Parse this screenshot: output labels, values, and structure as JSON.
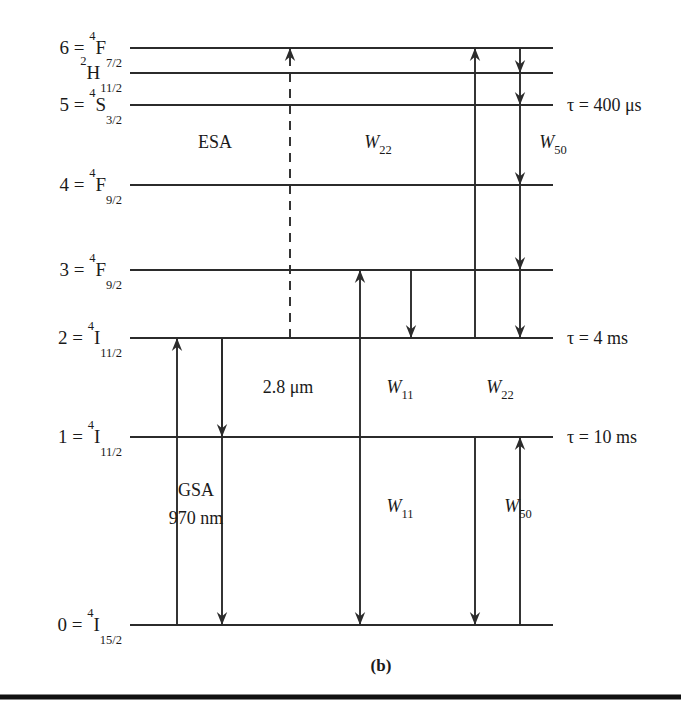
{
  "figure": {
    "caption": "(b)",
    "background_color": "#ffffff",
    "ink_color": "#2b2b2b",
    "width": 681,
    "height": 716
  },
  "chart_data": {
    "type": "diagram",
    "diagram_kind": "energy-level",
    "x_extent": [
      130,
      553
    ],
    "levels": [
      {
        "id": "L6",
        "index": "6",
        "eq": "=",
        "term_sup": "4",
        "term_letter": "F",
        "term_sub": "7/2",
        "label": "6 = 4F7/2",
        "y": 48,
        "x1": 130,
        "x2": 553,
        "lifetime": ""
      },
      {
        "id": "LH",
        "index": "",
        "eq": "",
        "term_sup": "2",
        "term_letter": "H",
        "term_sub": "11/2",
        "label": "2H11/2",
        "y": 73,
        "x1": 130,
        "x2": 553,
        "lifetime": ""
      },
      {
        "id": "L5",
        "index": "5",
        "eq": "=",
        "term_sup": "4",
        "term_letter": "S",
        "term_sub": "3/2",
        "label": "5 = 4S3/2",
        "y": 105,
        "x1": 130,
        "x2": 553,
        "lifetime": "τ = 400 μs"
      },
      {
        "id": "L4",
        "index": "4",
        "eq": "=",
        "term_sup": "4",
        "term_letter": "F",
        "term_sub": "9/2",
        "label": "4 = 4F9/2",
        "y": 185,
        "x1": 130,
        "x2": 553,
        "lifetime": ""
      },
      {
        "id": "L3",
        "index": "3",
        "eq": "=",
        "term_sup": "4",
        "term_letter": "F",
        "term_sub": "9/2",
        "label": "3 = 4F9/2",
        "y": 270,
        "x1": 130,
        "x2": 553,
        "lifetime": ""
      },
      {
        "id": "L2",
        "index": "2",
        "eq": "=",
        "term_sup": "4",
        "term_letter": "I",
        "term_sub": "11/2",
        "label": "2 = 4I11/2",
        "y": 338,
        "x1": 130,
        "x2": 553,
        "lifetime": "τ = 4 ms"
      },
      {
        "id": "L1",
        "index": "1",
        "eq": "=",
        "term_sup": "4",
        "term_letter": "I",
        "term_sub": "11/2",
        "label": "1 = 4I11/2",
        "y": 437,
        "x1": 130,
        "x2": 553,
        "lifetime": "τ = 10 ms"
      },
      {
        "id": "L0",
        "index": "0",
        "eq": "=",
        "term_sup": "4",
        "term_letter": "I",
        "term_sub": "15/2",
        "label": "0 = 4I15/2",
        "y": 625,
        "x1": 130,
        "x2": 553,
        "lifetime": ""
      }
    ],
    "transitions": [
      {
        "id": "esa",
        "x": 290,
        "from_y": 338,
        "to_y": 48,
        "direction": "up",
        "style": "dashed",
        "from_level": "L2",
        "to_level": "L6"
      },
      {
        "id": "gsa",
        "x": 177,
        "from_y": 625,
        "to_y": 338,
        "direction": "up",
        "style": "solid",
        "from_level": "L0",
        "to_level": "L2"
      },
      {
        "id": "decay-2-1",
        "x": 222,
        "from_y": 338,
        "to_y": 437,
        "direction": "down",
        "style": "solid",
        "from_level": "L2",
        "to_level": "L1"
      },
      {
        "id": "decay-2-0",
        "x": 222,
        "from_y": 338,
        "to_y": 625,
        "direction": "down",
        "style": "solid",
        "from_level": "L2",
        "to_level": "L0"
      },
      {
        "id": "w11-up",
        "x": 360,
        "from_y": 437,
        "to_y": 270,
        "direction": "up",
        "style": "solid",
        "from_level": "L1",
        "to_level": "L3"
      },
      {
        "id": "w11-down",
        "x": 411,
        "from_y": 270,
        "to_y": 338,
        "direction": "down",
        "style": "solid",
        "from_level": "L3",
        "to_level": "L2"
      },
      {
        "id": "w11-lower",
        "x": 360,
        "from_y": 437,
        "to_y": 625,
        "direction": "down",
        "style": "solid",
        "from_level": "L1",
        "to_level": "L0"
      },
      {
        "id": "w22-up",
        "x": 475,
        "from_y": 338,
        "to_y": 48,
        "direction": "up",
        "style": "solid",
        "from_level": "L2",
        "to_level": "L6"
      },
      {
        "id": "w22-down",
        "x": 475,
        "from_y": 437,
        "to_y": 625,
        "direction": "down",
        "style": "solid",
        "from_level": "L1",
        "to_level": "L0"
      },
      {
        "id": "w50-up",
        "x": 520,
        "from_y": 625,
        "to_y": 437,
        "direction": "up",
        "style": "solid",
        "from_level": "L0",
        "to_level": "L1"
      }
    ],
    "cascade": {
      "id": "w50-cascade",
      "x": 520,
      "start_y": 48,
      "end_y": 338,
      "direction": "down",
      "style": "solid",
      "stops": [
        73,
        105,
        185,
        270,
        338
      ]
    },
    "process_labels": [
      {
        "id": "esa-label",
        "text": "ESA",
        "italic": false,
        "sub": "",
        "x": 215,
        "y": 148
      },
      {
        "id": "w22-upper",
        "text": "W",
        "italic": true,
        "sub": "22",
        "x": 378,
        "y": 148
      },
      {
        "id": "w50-upper",
        "text": "W",
        "italic": true,
        "sub": "50",
        "x": 553,
        "y": 148
      },
      {
        "id": "mid-ir",
        "text": "2.8 μm",
        "italic": false,
        "sub": "",
        "x": 288,
        "y": 393
      },
      {
        "id": "w11-mid",
        "text": "W",
        "italic": true,
        "sub": "11",
        "x": 400,
        "y": 393
      },
      {
        "id": "w22-mid",
        "text": "W",
        "italic": true,
        "sub": "22",
        "x": 500,
        "y": 393
      },
      {
        "id": "w11-lower-label",
        "text": "W",
        "italic": true,
        "sub": "11",
        "x": 400,
        "y": 512
      },
      {
        "id": "w50-lower-label",
        "text": "W",
        "italic": true,
        "sub": "50",
        "x": 518,
        "y": 512
      }
    ],
    "gsa_block": {
      "id": "gsa-label",
      "line1": "GSA",
      "line2": "970 nm",
      "x": 196,
      "y1": 496,
      "y2": 524
    },
    "footer_rule": {
      "y": 697,
      "x1": 0,
      "x2": 681
    },
    "caption_position": {
      "x": 381,
      "y": 671
    }
  }
}
